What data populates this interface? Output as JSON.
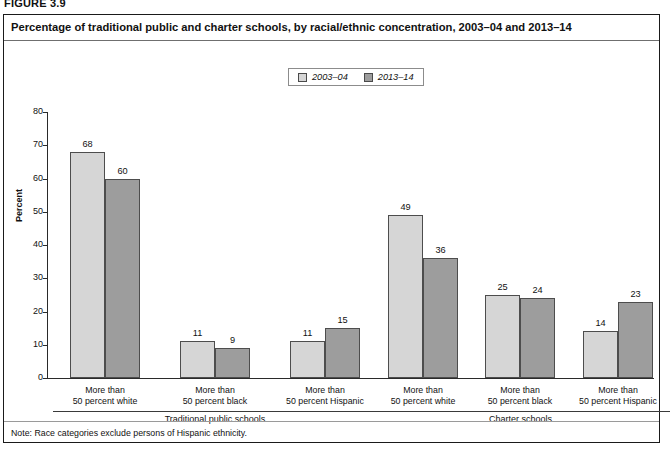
{
  "figure": {
    "number": "FIGURE 3.9",
    "title": "Percentage of traditional public and charter schools, by racial/ethnic concentration, 2003–04 and 2013–14",
    "note": "Note: Race categories exclude persons of Hispanic ethnicity."
  },
  "chart_data": {
    "type": "bar",
    "title": "Percentage of traditional public and charter schools, by racial/ethnic concentration, 2003–04 and 2013–14",
    "xlabel": "",
    "ylabel": "Percent",
    "ylim": [
      0,
      80
    ],
    "yticks": [
      0,
      10,
      20,
      30,
      40,
      50,
      60,
      70,
      80
    ],
    "grid": false,
    "legend_position": "top-center",
    "categories": [
      "More than 50 percent white",
      "More than 50 percent black",
      "More than 50 percent Hispanic",
      "More than 50 percent white",
      "More than 50 percent black",
      "More than 50 percent Hispanic"
    ],
    "category_lines": [
      [
        "More than",
        "50 percent white"
      ],
      [
        "More than",
        "50 percent black"
      ],
      [
        "More than",
        "50 percent Hispanic"
      ],
      [
        "More than",
        "50 percent white"
      ],
      [
        "More than",
        "50 percent black"
      ],
      [
        "More than",
        "50 percent Hispanic"
      ]
    ],
    "groups": [
      {
        "label": "Traditional public schools",
        "category_indices": [
          0,
          1,
          2
        ]
      },
      {
        "label": "Charter schools",
        "category_indices": [
          3,
          4,
          5
        ]
      }
    ],
    "series": [
      {
        "name": "2003–04",
        "color": "#d6d6d6",
        "values": [
          68,
          11,
          11,
          49,
          25,
          14
        ]
      },
      {
        "name": "2013–14",
        "color": "#9d9d9d",
        "values": [
          60,
          9,
          15,
          36,
          24,
          23
        ]
      }
    ]
  }
}
